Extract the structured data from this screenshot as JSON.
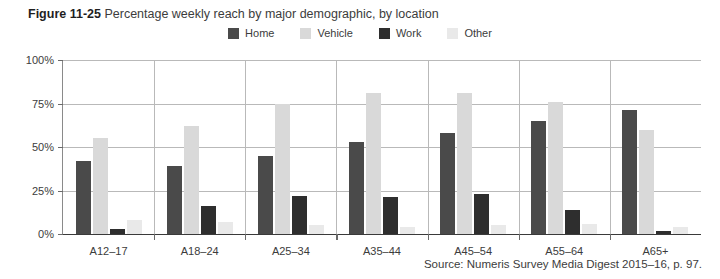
{
  "figure": {
    "label": "Figure 11-25",
    "title": "Percentage weekly reach by major demographic, by location"
  },
  "source": {
    "text": "Source: Numeris Survey Media Digest 2015–16, p. 97."
  },
  "colors": {
    "home": "#4a4a4a",
    "vehicle": "#d9d9d9",
    "work": "#2e2e2e",
    "other": "#e9e9e9",
    "gridline": "#b9b9b9",
    "axis": "#3a3a3a",
    "text": "#3c3c3c"
  },
  "chart_data": {
    "type": "bar",
    "title": "Percentage weekly reach by major demographic, by location",
    "xlabel": "",
    "ylabel": "",
    "ylim": [
      0,
      100
    ],
    "yticks": [
      0,
      25,
      50,
      75,
      100
    ],
    "ytick_labels": [
      "0%",
      "25%",
      "50%",
      "75%",
      "100%"
    ],
    "grid": true,
    "legend_position": "top-center",
    "categories": [
      "A12–17",
      "A18–24",
      "A25–34",
      "A35–44",
      "A45–54",
      "A55–64",
      "A65+"
    ],
    "series": [
      {
        "name": "Home",
        "color": "#4a4a4a",
        "values": [
          42,
          39,
          45,
          53,
          58,
          65,
          71
        ]
      },
      {
        "name": "Vehicle",
        "color": "#d9d9d9",
        "values": [
          55,
          62,
          75,
          81,
          81,
          76,
          60
        ]
      },
      {
        "name": "Work",
        "color": "#2e2e2e",
        "values": [
          3,
          16,
          22,
          21,
          23,
          14,
          2
        ]
      },
      {
        "name": "Other",
        "color": "#e9e9e9",
        "values": [
          8,
          7,
          5,
          4,
          5,
          6,
          4
        ]
      }
    ]
  }
}
